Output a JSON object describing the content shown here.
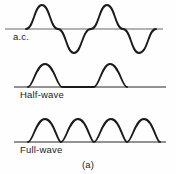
{
  "figure": {
    "caption": "(a)",
    "width": 176,
    "height": 174,
    "background_color": "#fefefe",
    "trace_color": "#1b1b1b",
    "axis_color": "#9a9a9a"
  },
  "panels": [
    {
      "id": "ac",
      "label": "a.c.",
      "baseline_y": 29,
      "baseline_x_start": 5,
      "baseline_x_end": 163
    },
    {
      "id": "half-wave",
      "label": "Half-wave",
      "baseline_y": 87,
      "baseline_x_start": 14,
      "baseline_x_end": 166
    },
    {
      "id": "full-wave",
      "label": "Full-wave",
      "baseline_y": 142,
      "baseline_x_start": 14,
      "baseline_x_end": 166
    }
  ],
  "chart_data": {
    "type": "line",
    "title": "(a)",
    "xlabel": "",
    "ylabel": "",
    "grid": false,
    "legend_position": "inline-left",
    "series": [
      {
        "name": "a.c.",
        "description": "Full sinusoidal alternating-current waveform, two complete cycles, symmetric about the zero axis.",
        "cycles": 2,
        "amplitude_px": 24,
        "baseline_y": 29,
        "x_start": 26,
        "x_end": 156,
        "zero_crossings_x": [
          26,
          58,
          91,
          123,
          156
        ],
        "peaks_x": [
          42,
          107
        ],
        "troughs_x": [
          74,
          139
        ],
        "peak_y": 5,
        "trough_y": 53,
        "path": "M26,29 C34,29 34,5 42,5 C50,5 50,29 58,29 C66,29 66,53 74,53 C82,53 82,29 91,29 C99,29 99,5 107,5 C115,5 115,29 123,29 C131,29 131,53 139,53 C148,53 148,29 156,29"
      },
      {
        "name": "Half-wave",
        "description": "Half-wave rectified output: only the positive half-cycles remain; negative half-cycles are zero (flat on the axis).",
        "humps": 2,
        "amplitude_px": 23,
        "baseline_y": 87,
        "hump_spans_x": [
          [
            28,
            62
          ],
          [
            94,
            127
          ]
        ],
        "peaks_x": [
          45,
          110
        ],
        "peak_y": 64,
        "path": "M28,87 C33,87 36,64 45,64 C54,64 57,87 62,87 L94,87 C99,87 102,64 110,64 C119,64 122,87 127,87"
      },
      {
        "name": "Full-wave",
        "description": "Full-wave rectified output: negative half-cycles are inverted, giving four consecutive positive humps with no gaps.",
        "humps": 4,
        "amplitude_px": 23,
        "baseline_y": 142,
        "hump_spans_x": [
          [
            28,
            61
          ],
          [
            61,
            94
          ],
          [
            94,
            127
          ],
          [
            127,
            160
          ]
        ],
        "peaks_x": [
          45,
          78,
          111,
          144
        ],
        "peak_y": 119,
        "path": "M28,142 C33,142 36,119 45,119 C54,119 57,142 61,142 C66,142 69,119 78,119 C87,119 90,142 94,142 C99,142 102,119 111,119 C120,119 123,142 127,142 C132,142 135,119 144,119 C153,119 156,142 160,142"
      }
    ]
  }
}
